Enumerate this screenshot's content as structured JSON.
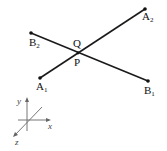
{
  "diagram": {
    "segments": [
      {
        "name": "A",
        "start": {
          "label": "A",
          "sub": "1",
          "x": 40,
          "y": 78
        },
        "end": {
          "label": "A",
          "sub": "2",
          "x": 145,
          "y": 9
        }
      },
      {
        "name": "B",
        "start": {
          "label": "B",
          "sub": "1",
          "x": 148,
          "y": 81
        },
        "end": {
          "label": "B",
          "sub": "2",
          "x": 31,
          "y": 33
        }
      }
    ],
    "intersection": {
      "upper_label": "Q",
      "lower_label": "P",
      "x": 78,
      "y": 53
    },
    "axes": {
      "x_label": "x",
      "y_label": "y",
      "z_label": "z"
    }
  }
}
